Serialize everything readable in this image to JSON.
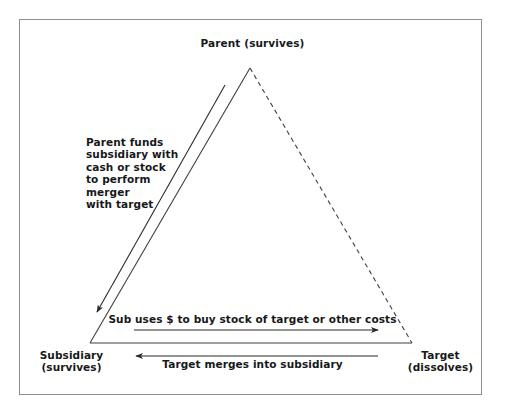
{
  "figure": {
    "type": "triangular-merger-diagram",
    "title_text": "Reverse triangular merger structure",
    "frame": {
      "border_color": "#8e8e8e"
    },
    "ink_color": "#16181a",
    "line_color": "#3a3a3a"
  },
  "nodes": {
    "parent": {
      "label": "Parent (survives)",
      "position": "apex"
    },
    "subsidiary": {
      "line1": "Subsidiary",
      "line2": "(survives)",
      "label": "Subsidiary\n(survives)",
      "position": "bottom-left"
    },
    "target": {
      "line1": "Target",
      "line2": "(dissolves)",
      "label": "Target\n(dissolves)",
      "position": "bottom-right"
    }
  },
  "annotations": {
    "parent_funds": {
      "label": "Parent funds\nsubsidiary with\ncash or stock\nto perform\nmerger\nwith target",
      "direction": "parent-to-subsidiary"
    },
    "sub_uses": {
      "label": "Sub uses $ to buy stock of target or other costs",
      "direction": "subsidiary-to-target"
    },
    "target_merges": {
      "label": "Target merges into subsidiary",
      "direction": "target-to-subsidiary"
    }
  },
  "edges": {
    "parent_to_subsidiary": {
      "style": "solid",
      "name": "left-edge"
    },
    "parent_to_target": {
      "style": "dashed",
      "name": "right-edge"
    },
    "subsidiary_to_target": {
      "style": "solid",
      "name": "bottom-edge"
    }
  }
}
